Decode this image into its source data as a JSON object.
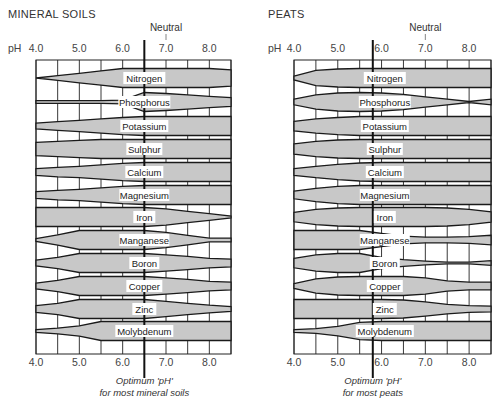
{
  "chart_data": [
    {
      "type": "area",
      "title": "MINERAL SOILS",
      "xlabel": "pH",
      "x_ticks": [
        "4.0",
        "5.0",
        "6.0",
        "7.0",
        "8.0"
      ],
      "x_range": [
        4.0,
        8.5
      ],
      "grid_x": [
        4.0,
        4.5,
        5.0,
        5.5,
        6.0,
        6.5,
        7.0,
        7.5,
        8.0,
        8.5
      ],
      "neutral_label": "Neutral",
      "neutral_ph": 7.0,
      "optimum_ph": 6.5,
      "optimum_caption": [
        "Optimum 'pH'",
        "for most mineral soils"
      ],
      "value_meaning": "relative availability (band half-width, 0-1) at pH 4.0,4.5,...,8.5",
      "series": [
        {
          "name": "Nitrogen",
          "values": [
            0.0,
            0.25,
            0.5,
            0.75,
            1.0,
            1.0,
            1.0,
            1.0,
            1.0,
            0.85
          ]
        },
        {
          "name": "Phosphorus",
          "values": [
            0.15,
            0.15,
            0.15,
            0.15,
            0.2,
            1.0,
            0.9,
            0.75,
            0.6,
            0.45
          ]
        },
        {
          "name": "Potassium",
          "values": [
            0.3,
            0.45,
            0.6,
            0.75,
            0.9,
            1.0,
            1.0,
            1.0,
            1.0,
            1.0
          ]
        },
        {
          "name": "Sulphur",
          "values": [
            0.7,
            0.8,
            0.9,
            1.0,
            1.0,
            1.0,
            1.0,
            1.0,
            1.0,
            1.0
          ]
        },
        {
          "name": "Calcium",
          "values": [
            0.35,
            0.5,
            0.6,
            0.75,
            0.9,
            1.0,
            1.0,
            1.0,
            1.0,
            1.0
          ]
        },
        {
          "name": "Magnesium",
          "values": [
            0.35,
            0.5,
            0.6,
            0.75,
            0.9,
            1.0,
            1.0,
            1.0,
            1.0,
            1.0
          ]
        },
        {
          "name": "Iron",
          "values": [
            1.0,
            1.0,
            1.0,
            1.0,
            1.0,
            1.0,
            0.85,
            0.6,
            0.35,
            0.1
          ]
        },
        {
          "name": "Manganese",
          "values": [
            0.15,
            0.55,
            1.0,
            1.0,
            1.0,
            1.0,
            0.8,
            0.5,
            0.2,
            0.2
          ]
        },
        {
          "name": "Boron",
          "values": [
            0.3,
            0.6,
            1.0,
            1.0,
            1.0,
            1.0,
            0.85,
            0.7,
            0.5,
            0.4
          ]
        },
        {
          "name": "Copper",
          "values": [
            0.3,
            0.6,
            1.0,
            1.0,
            1.0,
            1.0,
            0.85,
            0.7,
            0.5,
            0.4
          ]
        },
        {
          "name": "Zinc",
          "values": [
            0.35,
            0.6,
            1.0,
            1.0,
            1.0,
            1.0,
            0.8,
            0.6,
            0.4,
            0.25
          ]
        },
        {
          "name": "Molybdenum",
          "values": [
            0.15,
            0.3,
            0.55,
            1.0,
            1.0,
            1.0,
            1.0,
            1.0,
            1.0,
            1.0
          ]
        }
      ]
    },
    {
      "type": "area",
      "title": "PEATS",
      "xlabel": "pH",
      "x_ticks": [
        "4.0",
        "5.0",
        "6.0",
        "7.0",
        "8.0"
      ],
      "x_range": [
        4.0,
        8.5
      ],
      "grid_x": [
        4.0,
        4.5,
        5.0,
        5.5,
        6.0,
        6.5,
        7.0,
        7.5,
        8.0,
        8.5
      ],
      "neutral_label": "Neutral",
      "neutral_ph": 7.0,
      "optimum_ph": 5.8,
      "optimum_caption": [
        "Optimum 'pH'",
        "for most peats"
      ],
      "value_meaning": "relative availability (band half-width, 0-1) at pH 4.0,4.5,...,8.5",
      "series": [
        {
          "name": "Nitrogen",
          "values": [
            0.2,
            0.8,
            0.95,
            1.0,
            1.0,
            1.0,
            1.0,
            1.0,
            1.0,
            1.0
          ]
        },
        {
          "name": "Phosphorus",
          "values": [
            0.3,
            0.75,
            0.95,
            1.0,
            0.95,
            0.8,
            0.55,
            0.3,
            0.05,
            0.3
          ]
        },
        {
          "name": "Potassium",
          "values": [
            0.5,
            0.75,
            0.9,
            1.0,
            1.0,
            1.0,
            1.0,
            1.0,
            1.0,
            1.0
          ]
        },
        {
          "name": "Sulphur",
          "values": [
            0.55,
            0.8,
            0.95,
            1.0,
            1.0,
            1.0,
            1.0,
            1.0,
            1.0,
            1.0
          ]
        },
        {
          "name": "Calcium",
          "values": [
            0.35,
            0.6,
            0.8,
            0.95,
            1.0,
            1.0,
            1.0,
            1.0,
            1.0,
            1.0
          ]
        },
        {
          "name": "Magnesium",
          "values": [
            0.4,
            0.7,
            0.9,
            1.0,
            1.0,
            1.0,
            1.0,
            1.0,
            1.0,
            1.0
          ]
        },
        {
          "name": "Iron",
          "values": [
            0.5,
            0.8,
            0.95,
            1.0,
            1.0,
            1.0,
            1.0,
            0.95,
            0.8,
            0.55
          ]
        },
        {
          "name": "Manganese",
          "values": [
            1.0,
            1.0,
            1.0,
            1.0,
            0.7,
            0.4,
            0.3,
            0.3,
            0.35,
            0.5
          ]
        },
        {
          "name": "Boron",
          "values": [
            0.5,
            0.85,
            1.0,
            1.0,
            0.6,
            0.35,
            0.2,
            0.1,
            0.1,
            0.25
          ]
        },
        {
          "name": "Copper",
          "values": [
            0.25,
            0.75,
            0.95,
            1.0,
            1.0,
            1.0,
            0.85,
            0.55,
            0.4,
            0.4
          ]
        },
        {
          "name": "Zinc",
          "values": [
            1.0,
            1.0,
            1.0,
            1.0,
            1.0,
            0.95,
            0.75,
            0.5,
            0.35,
            0.3
          ]
        },
        {
          "name": "Molybdenum",
          "values": [
            0.15,
            0.25,
            0.5,
            0.9,
            1.0,
            1.0,
            1.0,
            1.0,
            1.0,
            1.0
          ]
        }
      ]
    }
  ],
  "panels": {
    "left": {
      "title": "MINERAL SOILS",
      "ph_label": "pH"
    },
    "right": {
      "title": "PEATS",
      "ph_label": "pH"
    }
  }
}
